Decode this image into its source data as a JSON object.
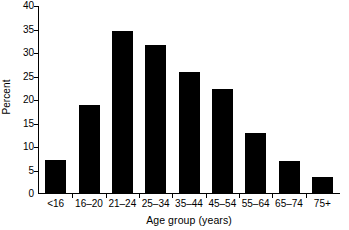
{
  "chart_data": {
    "type": "bar",
    "title": "",
    "xlabel": "Age group (years)",
    "ylabel": "Percent",
    "categories": [
      "<16",
      "16–20",
      "21–24",
      "25–34",
      "35–44",
      "45–54",
      "55–64",
      "65–74",
      "75+"
    ],
    "values": [
      7.1,
      18.8,
      34.4,
      31.5,
      25.8,
      22.1,
      12.7,
      6.9,
      3.5
    ],
    "ylim": [
      0,
      40
    ],
    "yticks": [
      0,
      5,
      10,
      15,
      20,
      25,
      30,
      35,
      40
    ],
    "ytick_labels": [
      "0",
      "5",
      "10",
      "15",
      "20",
      "25",
      "30",
      "35",
      "40"
    ],
    "grid": false,
    "legend": false,
    "bar_color": "#000000",
    "background_color": "#ffffff",
    "axis_color": "#000000"
  }
}
